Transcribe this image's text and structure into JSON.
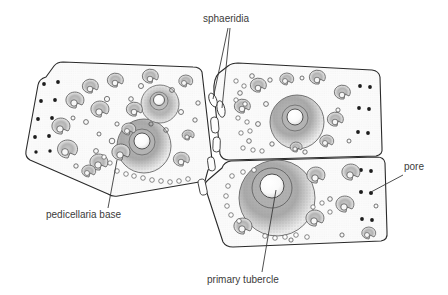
{
  "figure": {
    "background_color": "#ffffff",
    "ink_color": "#2a2a2a",
    "label_color": "#3b3b3b",
    "plate_fill": "#fbfbfb",
    "width": 448,
    "height": 295
  },
  "labels": [
    {
      "id": "sphaeridia",
      "text": "sphaeridia",
      "x": 203,
      "y": 22,
      "anchor": "start",
      "leaders": [
        {
          "x1": 228,
          "y1": 28,
          "x2": 213,
          "y2": 99
        },
        {
          "x1": 230,
          "y1": 28,
          "x2": 222,
          "y2": 108
        }
      ]
    },
    {
      "id": "pedicellaria-base",
      "text": "pedicellaria base",
      "x": 46,
      "y": 218,
      "anchor": "start",
      "leaders": [
        {
          "x1": 108,
          "y1": 208,
          "x2": 117,
          "y2": 160
        }
      ]
    },
    {
      "id": "primary-tubercle",
      "text": "primary tubercle",
      "x": 207,
      "y": 283,
      "anchor": "start",
      "leaders": [
        {
          "x1": 262,
          "y1": 272,
          "x2": 276,
          "y2": 190
        }
      ]
    },
    {
      "id": "pore",
      "text": "pore",
      "x": 404,
      "y": 170,
      "anchor": "start",
      "leaders": [
        {
          "x1": 403,
          "y1": 175,
          "x2": 371,
          "y2": 192
        }
      ]
    }
  ],
  "plates": [
    {
      "id": "left-plate",
      "name": "left interambulacral plate",
      "outline": "M 46,77 L 54,66 Q 57,62 63,62 L 193,67 Q 200,67 202,72 L 212,160 Q 214,167 208,170 L 205,181 L 118,196 Q 112,197 108,194 L 30,160 Q 25,157 26,151 L 38,85 Q 39,79 46,77 Z"
    },
    {
      "id": "right-upper-plate",
      "name": "upper right interambulacral plate",
      "outline": "M 219,73 L 228,66 Q 232,63 238,63 L 372,70 Q 379,71 380,77 L 382,148 Q 383,155 376,156 L 229,160 Q 222,160 220,154 L 214,92 Q 213,79 219,73 Z"
    },
    {
      "id": "right-lower-plate",
      "name": "lower right interambulacral plate",
      "outline": "M 222,168 Q 224,162 231,161 L 377,157 Q 384,157 385,163 L 387,232 Q 388,240 381,241 L 233,247 Q 226,247 223,242 L 206,190 Q 203,184 208,180 Z"
    }
  ],
  "primary_tubercles": [
    {
      "cx": 277,
      "cy": 198,
      "r_outer": 38,
      "r_inner": 20,
      "r_boss": 12,
      "label": "largest primary tubercle"
    },
    {
      "cx": 144,
      "cy": 146,
      "r_outer": 27,
      "r_inner": 13,
      "r_boss": 8,
      "label": "primary tubercle left plate"
    },
    {
      "cx": 297,
      "cy": 122,
      "r_outer": 27,
      "r_inner": 13,
      "r_boss": 8,
      "label": "primary tubercle upper right plate"
    },
    {
      "cx": 160,
      "cy": 104,
      "r_outer": 19,
      "r_inner": 9,
      "r_boss": 5.5,
      "label": "secondary large tubercle"
    }
  ],
  "icons": {
    "sphaeridium": "elongate-capsule",
    "pore": "dark-round-dot",
    "tubercle": "stippled-ring-with-boss",
    "pedicellaria_base": "crescent-open-ring"
  },
  "counts": {
    "plates": 3,
    "labels": 4,
    "primary_tubercles": 4,
    "sphaeridia": 6
  }
}
